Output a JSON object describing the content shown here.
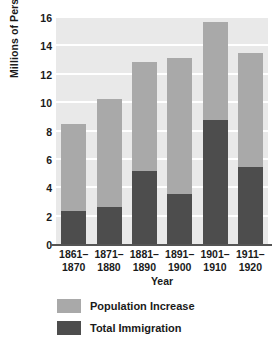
{
  "chart_data": {
    "type": "bar",
    "subtype": "stacked",
    "title": "",
    "xlabel": "Year",
    "ylabel": "Millions of Persons",
    "categories": [
      "1861–1870",
      "1871–1880",
      "1881–1890",
      "1891–1900",
      "1901–1910",
      "1911–1920"
    ],
    "category_lines": [
      [
        "1861–",
        "1870"
      ],
      [
        "1871–",
        "1880"
      ],
      [
        "1881–",
        "1890"
      ],
      [
        "1891–",
        "1900"
      ],
      [
        "1901–",
        "1910"
      ],
      [
        "1911–",
        "1920"
      ]
    ],
    "series": [
      {
        "name": "Total Immigration",
        "color": "#4d4d4d",
        "values": [
          2.4,
          2.7,
          5.2,
          3.6,
          8.8,
          5.5
        ]
      },
      {
        "name": "Population Increase",
        "color": "#a9a9a9",
        "values": [
          6.1,
          7.6,
          7.7,
          9.6,
          6.9,
          8.0
        ]
      }
    ],
    "totals": [
      8.5,
      10.3,
      12.9,
      13.2,
      15.7,
      13.5
    ],
    "ylim": [
      0,
      16
    ],
    "yticks": [
      0,
      2,
      4,
      6,
      8,
      10,
      12,
      14,
      16
    ],
    "ytick_labels": [
      "0",
      "2",
      "4",
      "6",
      "8",
      "10",
      "12",
      "14",
      "16"
    ],
    "grid": true,
    "grid_color": "#ffffff",
    "plot_background": "#e9e9e9",
    "legend_position": "below",
    "legend": [
      {
        "label": "Population Increase",
        "color": "#a9a9a9"
      },
      {
        "label": "Total Immigration",
        "color": "#4d4d4d"
      }
    ]
  }
}
